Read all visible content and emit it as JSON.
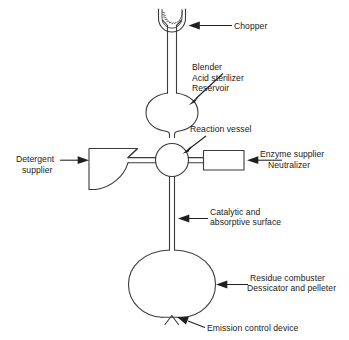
{
  "figure": {
    "kind": "process-apparatus-schematic",
    "background_color": "#ffffff",
    "line_color": "#3b3b3b",
    "text_color": "#1a1a1a",
    "width": 349,
    "height": 340
  },
  "labels": {
    "chopper": "Chopper",
    "blender": "Blender",
    "acid_sterilizer": "Acid sterilizer",
    "reservoir": "Reservoir",
    "reaction_vessel": "Reaction vessel",
    "enzyme_supplier": "Enzyme supplier",
    "neutralizer": "Neutralizer",
    "detergent": "Detergent",
    "supplier": "supplier",
    "catalytic": "Catalytic and",
    "absorptive_surface": "absorptive surface",
    "residue_combuster": "Residue combuster",
    "dessicator": "Dessicator and pelleter",
    "emission_control": "Emission control device"
  },
  "components": [
    {
      "id": "chopper",
      "shape": "toothed-u-hopper",
      "label": "Chopper"
    },
    {
      "id": "reservoir",
      "shape": "barrel",
      "label": "Blender / Acid sterilizer / Reservoir"
    },
    {
      "id": "reaction-vessel",
      "shape": "circle",
      "label": "Reaction vessel"
    },
    {
      "id": "enzyme-supplier",
      "shape": "rectangle",
      "label": "Enzyme supplier / Neutralizer"
    },
    {
      "id": "detergent-supplier",
      "shape": "funnel-wedge",
      "label": "Detergent supplier"
    },
    {
      "id": "catalytic-column",
      "shape": "double-line-tube",
      "label": "Catalytic and absorptive surface"
    },
    {
      "id": "residue-combuster",
      "shape": "circle",
      "label": "Residue combuster / Dessicator and pelleter"
    },
    {
      "id": "emission-control",
      "shape": "v-notch-valve",
      "label": "Emission control device"
    }
  ]
}
